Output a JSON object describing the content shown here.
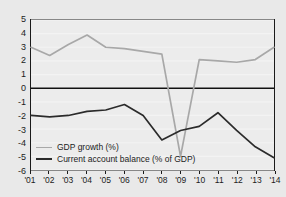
{
  "chart_data": {
    "type": "line",
    "title": "",
    "subtitle": "",
    "xlabel": "",
    "ylabel": "",
    "x": [
      "'01",
      "'02",
      "'03",
      "'04",
      "'05",
      "'06",
      "'07",
      "'08",
      "'09",
      "'10",
      "'11",
      "'12",
      "'13",
      "'14"
    ],
    "xlim": [
      0,
      13
    ],
    "ylim": [
      -6,
      5
    ],
    "yticks": [
      5,
      4,
      3,
      2,
      1,
      0,
      -1,
      -2,
      -3,
      -4,
      -5,
      -6
    ],
    "ytick_labels": [
      "5",
      "4",
      "3",
      "2",
      "1",
      "0",
      "-1",
      "-2",
      "-3",
      "-4",
      "-5",
      "-6"
    ],
    "grid": true,
    "grid_axis": "y",
    "legend_position": "bottom-left",
    "zero_line": 0,
    "series": [
      {
        "name": "GDP growth (%)",
        "color": "#a8a8a8",
        "values": [
          3.0,
          2.4,
          3.2,
          3.9,
          3.0,
          2.9,
          2.7,
          2.5,
          -5.0,
          2.1,
          2.0,
          1.9,
          2.1,
          3.0
        ]
      },
      {
        "name": "Current account balance (% of GDP)",
        "color": "#2b2b2b",
        "values": [
          -2.0,
          -2.1,
          -2.0,
          -1.7,
          -1.6,
          -1.2,
          -2.0,
          -3.8,
          -3.1,
          -2.8,
          -1.8,
          -3.1,
          -4.3,
          -5.1
        ]
      }
    ]
  },
  "legend": {
    "items": [
      {
        "label": "GDP growth (%)",
        "color": "#a8a8a8"
      },
      {
        "label": "Current account balance (% of GDP)",
        "color": "#2b2b2b"
      }
    ]
  },
  "colors": {
    "figure_background": "#e9e9e9",
    "plot_background": "#ececec",
    "frame": "#1a1a1a",
    "gridline": "#f3f3f3",
    "zero_line": "#111111",
    "gdp_growth": "#a8a8a8",
    "current_account": "#2b2b2b",
    "text": "#1c1c1c"
  }
}
